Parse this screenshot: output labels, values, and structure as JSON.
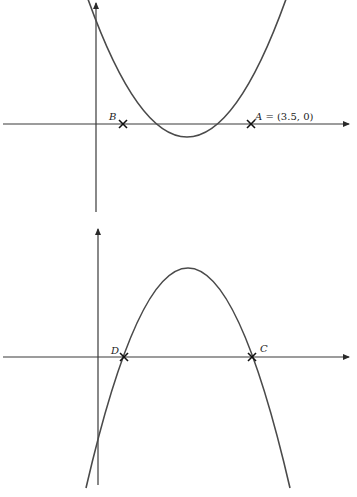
{
  "graphs": [
    {
      "name": "upward-parabola",
      "points": [
        {
          "id": "B",
          "label": "B",
          "x": 123,
          "y": 124
        },
        {
          "id": "A",
          "label": "A",
          "coord_text": " = (3.5, 0)",
          "x": 251,
          "y": 124
        }
      ],
      "axes": {
        "x_axis_y": 124,
        "y_axis_x": 96
      },
      "vertex": {
        "x": 187,
        "y": 208
      },
      "opens": "up"
    },
    {
      "name": "downward-parabola",
      "points": [
        {
          "id": "D",
          "label": "D",
          "x": 124,
          "y": 357
        },
        {
          "id": "C",
          "label": "C",
          "x": 252,
          "y": 357
        }
      ],
      "axes": {
        "x_axis_y": 357,
        "y_axis_x": 98
      },
      "vertex": {
        "x": 188,
        "y": 268
      },
      "opens": "down"
    }
  ],
  "colors": {
    "axis": "#3a3a3a",
    "curve": "#4a4a4a",
    "marker": "#111111"
  }
}
